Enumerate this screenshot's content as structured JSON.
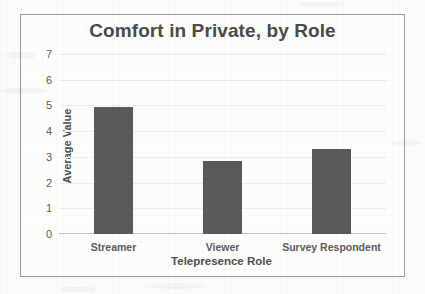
{
  "chart_data": {
    "type": "bar",
    "title": "Comfort in Private, by Role",
    "xlabel": "Telepresence Role",
    "ylabel": "Average Value",
    "categories": [
      "Streamer",
      "Viewer",
      "Survey Respondent"
    ],
    "values": [
      4.95,
      2.85,
      3.3
    ],
    "ylim": [
      0,
      7
    ],
    "yticks": [
      0,
      1,
      2,
      3,
      4,
      5,
      6,
      7
    ],
    "ytick_labels": [
      "0",
      "1",
      "2",
      "3",
      "4",
      "5",
      "6",
      "7"
    ],
    "grid": true,
    "legend": false,
    "bar_color": "#5a5a5a",
    "title_color": "#4a4a4a",
    "gridline_color": "#ececeb",
    "axis_color": "#c9c9c7",
    "plot_background": "#fdfdfc",
    "border_color": "#9a9a9a"
  }
}
